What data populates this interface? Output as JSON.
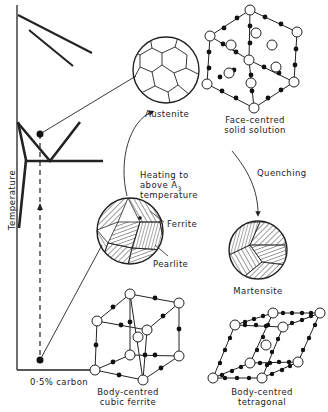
{
  "phase_diagram": {
    "y_axis_label": "Temperature",
    "x_marker_label": "0·5% carbon"
  },
  "structures": {
    "austenite": {
      "label": "Austenite"
    },
    "pearlite_ferrite": {
      "ferrite_label": "Ferrite",
      "pearlite_label": "Pearlite"
    },
    "martensite": {
      "label": "Martensite"
    },
    "fcc": {
      "line1": "Face-centred",
      "line2": "solid solution"
    },
    "bcc": {
      "line1": "Body-centred",
      "line2": "cubic ferrite"
    },
    "bct": {
      "line1": "Body-centred",
      "line2": "tetragonal"
    }
  },
  "processes": {
    "heating": {
      "line1": "Heating to",
      "line2": "above A",
      "subscript": "3",
      "line3": "temperature"
    },
    "quenching": {
      "label": "Quenching"
    }
  }
}
